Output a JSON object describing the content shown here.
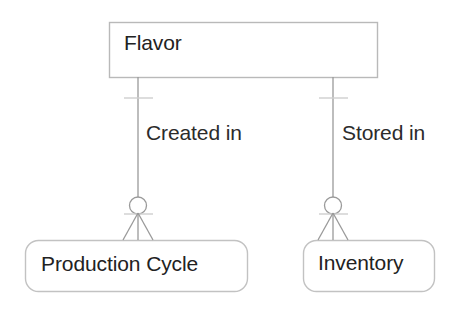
{
  "diagram": {
    "type": "entity-relationship-diagram",
    "notation": "crows-foot",
    "background_color": "#ffffff",
    "entities": [
      {
        "id": "flavor",
        "name": "Flavor",
        "shape": "rectangle",
        "border_color": "#b9b9b9",
        "fill_color": "#ffffff",
        "text_color": "#222222"
      },
      {
        "id": "production_cycle",
        "name": "Production Cycle",
        "shape": "rounded-rectangle",
        "border_color": "#c2c2c2",
        "fill_color": "#ffffff",
        "text_color": "#222222"
      },
      {
        "id": "inventory",
        "name": "Inventory",
        "shape": "rounded-rectangle",
        "border_color": "#c2c2c2",
        "fill_color": "#ffffff",
        "text_color": "#222222"
      }
    ],
    "relationships": [
      {
        "id": "created_in",
        "label": "Created in",
        "from": "flavor",
        "to": "production_cycle",
        "from_cardinality": "exactly-one",
        "to_cardinality": "zero-or-many",
        "line_color": "#9a9a9a"
      },
      {
        "id": "stored_in",
        "label": "Stored in",
        "from": "flavor",
        "to": "inventory",
        "from_cardinality": "exactly-one",
        "to_cardinality": "zero-or-many",
        "line_color": "#9a9a9a"
      }
    ]
  }
}
